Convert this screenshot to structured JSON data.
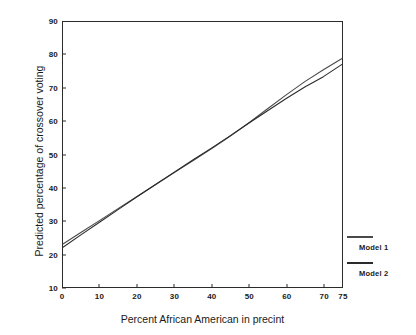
{
  "chart_data": {
    "type": "line",
    "title": "",
    "xlabel": "Percent African American in precint",
    "ylabel": "Predicted percentage of crossover voting",
    "xlim": [
      0,
      75
    ],
    "ylim": [
      10,
      90
    ],
    "grid": false,
    "legend_position": "right",
    "xticks": [
      0,
      10,
      20,
      30,
      40,
      50,
      60,
      70,
      75
    ],
    "xtick_labels": [
      "0",
      "10",
      "20",
      "30",
      "40",
      "50",
      "60",
      "70",
      "75"
    ],
    "yticks": [
      10,
      20,
      30,
      40,
      50,
      60,
      70,
      80,
      90
    ],
    "ytick_labels": [
      "10",
      "20",
      "30",
      "40",
      "50",
      "60",
      "70",
      "80",
      "90"
    ],
    "x": [
      0,
      5,
      10,
      15,
      20,
      25,
      30,
      35,
      40,
      45,
      50,
      55,
      60,
      65,
      70,
      75
    ],
    "series": [
      {
        "name": "Model 1",
        "color": "#4a4a4a",
        "values": [
          23.0,
          26.6,
          30.2,
          33.8,
          37.4,
          41.0,
          44.6,
          48.2,
          51.8,
          55.6,
          59.6,
          63.8,
          68.0,
          72.0,
          75.6,
          79.0
        ]
      },
      {
        "name": "Model 2",
        "color": "#2b2b2b",
        "values": [
          22.0,
          25.9,
          29.7,
          33.5,
          37.3,
          41.0,
          44.7,
          48.4,
          52.0,
          55.7,
          59.5,
          63.2,
          66.9,
          70.4,
          73.5,
          77.2
        ]
      }
    ]
  },
  "legend": {
    "entries": [
      {
        "label": "Model 1"
      },
      {
        "label": "Model 2"
      }
    ]
  }
}
